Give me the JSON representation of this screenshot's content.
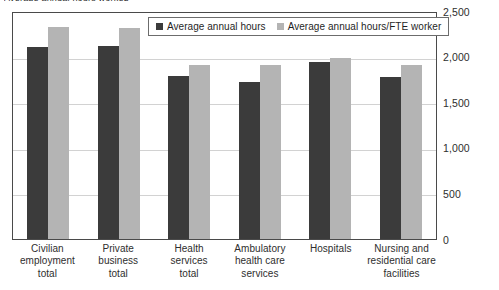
{
  "chart_data": {
    "type": "bar",
    "title": "Average annual hours worked",
    "xlabel": "",
    "ylabel": "",
    "ylim": [
      0,
      2500
    ],
    "ytick_step": 500,
    "ytick_labels": [
      "2,500",
      "2,000",
      "1,500",
      "1,000",
      "500",
      "0"
    ],
    "ytick_values": [
      2500,
      2000,
      1500,
      1000,
      500,
      0
    ],
    "yaxis_position": "right",
    "grid": true,
    "legend_position": "top-center",
    "categories": [
      "Civilian employment total",
      "Private business total",
      "Health services total",
      "Ambulatory health care services",
      "Hospitals",
      "Nursing and residential care facilities"
    ],
    "category_lines": [
      [
        "Civilian",
        "employment",
        "total"
      ],
      [
        "Private",
        "business",
        "total"
      ],
      [
        "Health",
        "services",
        "total"
      ],
      [
        "Ambulatory",
        "health care",
        "services"
      ],
      [
        "Hospitals"
      ],
      [
        "Nursing and",
        "residential care",
        "facilities"
      ]
    ],
    "series": [
      {
        "name": "Average annual hours",
        "color": "#3b3b3b",
        "values": [
          2100,
          2120,
          1790,
          1725,
          1940,
          1780
        ]
      },
      {
        "name": "Average annual hours/FTE worker",
        "color": "#b4b4b4",
        "values": [
          2325,
          2315,
          1910,
          1910,
          1985,
          1910
        ]
      }
    ]
  },
  "legend": {
    "items": [
      {
        "label": "Average annual hours",
        "swatch": "s1"
      },
      {
        "label": "Average annual hours/FTE worker",
        "swatch": "s2"
      }
    ]
  },
  "colors": {
    "series1": "#3b3b3b",
    "series2": "#b4b4b4",
    "frame": "#4a4a4a",
    "gridline": "#d2d2d2",
    "text": "#2e2e2e",
    "background": "#ffffff"
  }
}
